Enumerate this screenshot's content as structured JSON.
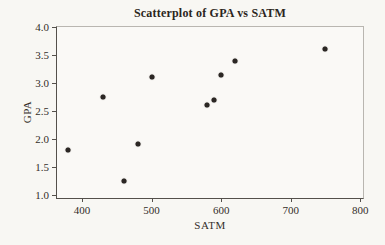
{
  "figure": {
    "background_color": "#f8f7f3"
  },
  "chart_data": {
    "type": "scatter",
    "title": "Scatterplot of GPA vs SATM",
    "xlabel": "SATM",
    "ylabel": "GPA",
    "x_ticks": [
      "400",
      "500",
      "600",
      "700",
      "800"
    ],
    "y_ticks": [
      "1.0",
      "1.5",
      "2.0",
      "2.5",
      "3.0",
      "3.5",
      "4.0"
    ],
    "xlim": [
      364,
      804
    ],
    "ylim": [
      0.94,
      4.0
    ],
    "grid": false,
    "legend": null,
    "point_color": "#2b2724",
    "axis_color": "#54504b",
    "text_color": "#332e29",
    "points": [
      {
        "satm": 380,
        "gpa": 1.8
      },
      {
        "satm": 430,
        "gpa": 2.75
      },
      {
        "satm": 460,
        "gpa": 1.25
      },
      {
        "satm": 480,
        "gpa": 1.9
      },
      {
        "satm": 500,
        "gpa": 3.1
      },
      {
        "satm": 580,
        "gpa": 2.6
      },
      {
        "satm": 590,
        "gpa": 2.7
      },
      {
        "satm": 600,
        "gpa": 3.15
      },
      {
        "satm": 620,
        "gpa": 3.4
      },
      {
        "satm": 750,
        "gpa": 3.6
      }
    ]
  }
}
